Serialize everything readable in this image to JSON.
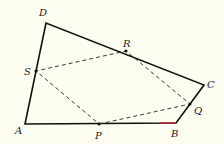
{
  "diagram": {
    "type": "geometry-quadrilateral",
    "background": "#fdfdf2",
    "stroke_color": "#111111",
    "highlight_color": "#b0283a",
    "vertices": {
      "A": {
        "label": "A",
        "x": 25,
        "y": 124,
        "lx": 15,
        "ly": 134
      },
      "B": {
        "label": "B",
        "x": 176,
        "y": 123,
        "lx": 171,
        "ly": 137
      },
      "C": {
        "label": "C",
        "x": 204,
        "y": 85,
        "lx": 207,
        "ly": 88
      },
      "D": {
        "label": "D",
        "x": 46,
        "y": 23,
        "lx": 39,
        "ly": 16
      }
    },
    "midpoints": {
      "P": {
        "label": "P",
        "x": 99,
        "y": 124,
        "lx": 95,
        "ly": 139
      },
      "Q": {
        "label": "Q",
        "x": 190,
        "y": 104,
        "lx": 194,
        "ly": 114
      },
      "R": {
        "label": "R",
        "x": 126,
        "y": 51,
        "lx": 123,
        "ly": 47
      },
      "S": {
        "label": "S",
        "x": 36,
        "y": 71,
        "lx": 24,
        "ly": 75
      }
    },
    "solid_edges": [
      "AB",
      "BC",
      "CD",
      "DA"
    ],
    "dashed_edges": [
      "PQ",
      "QR",
      "RS",
      "SP"
    ],
    "highlight_segment": {
      "from_x": 160,
      "to_x": 176,
      "y": 123
    }
  }
}
